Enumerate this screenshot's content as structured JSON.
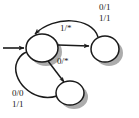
{
  "figure": {
    "type": "state-transition-diagram",
    "background_color": "#ffffff",
    "stroke_color": "#1a1a1a",
    "node_fill_color": "#ffffff",
    "shadow_color": "#9a9a9a",
    "width": 139,
    "height": 118
  },
  "states": [
    {
      "id": "s0",
      "name": "state-left",
      "cx": 42,
      "cy": 48,
      "rx": 16,
      "ry": 14,
      "is_initial": true,
      "label": ""
    },
    {
      "id": "s1",
      "name": "state-right",
      "cx": 105,
      "cy": 49,
      "rx": 14,
      "ry": 13,
      "is_initial": false,
      "label": ""
    },
    {
      "id": "s2",
      "name": "state-bottom",
      "cx": 70,
      "cy": 93,
      "rx": 14,
      "ry": 12,
      "is_initial": false,
      "label": ""
    }
  ],
  "start_arrow": {
    "name": "initial-state-arrow",
    "from_x": 3,
    "to_x": 26,
    "y": 48
  },
  "transitions": [
    {
      "id": "t1",
      "from": "s0",
      "to": "s1",
      "label": "1/*",
      "label_x": 64,
      "label_y": 28,
      "shape": "straight"
    },
    {
      "id": "t2",
      "from": "s1",
      "to": "s0",
      "label_lines": [
        "0/1",
        "1/1"
      ],
      "label_x": 100,
      "label_y": 3,
      "shape": "arc-top"
    },
    {
      "id": "t3",
      "from": "s0",
      "to": "s2",
      "label": "0/*",
      "label_x": 60,
      "label_y": 61,
      "shape": "straight-diagonal"
    },
    {
      "id": "t4",
      "from": "s2",
      "to": "s0",
      "label_lines": [
        "0/0",
        "1/1"
      ],
      "label_x": 13,
      "label_y": 89,
      "shape": "arc-left"
    }
  ]
}
